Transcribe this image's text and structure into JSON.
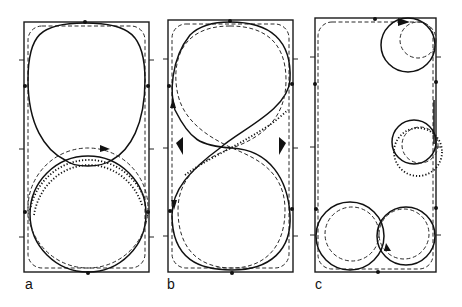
{
  "figure": {
    "panels": [
      {
        "id": "a",
        "label": "a",
        "description": "Trajectory in rectangle: upper rounded loop, lower circle, dotted circular path with arrow"
      },
      {
        "id": "b",
        "label": "b",
        "description": "Figure-eight trajectory with dashed and dotted paths, filled arrowheads at midline"
      },
      {
        "id": "c",
        "label": "c",
        "description": "Small circular orbits near right edge and two circles at bottom"
      }
    ],
    "colors": {
      "ink": "#111111",
      "background": "#ffffff"
    }
  }
}
